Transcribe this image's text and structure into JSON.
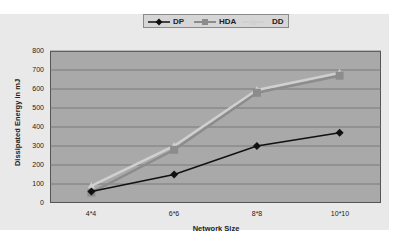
{
  "chart_data": {
    "type": "line",
    "title": "",
    "xlabel": "Network Size",
    "ylabel": "Dissipated Energy in mJ",
    "categories": [
      "4*4",
      "6*6",
      "8*8",
      "10*10"
    ],
    "series": [
      {
        "name": "DP",
        "values": [
          60,
          150,
          300,
          370
        ],
        "color": "#111111",
        "marker": "diamond"
      },
      {
        "name": "HDA",
        "values": [
          55,
          280,
          580,
          670
        ],
        "color": "#8c8c8c",
        "marker": "square"
      },
      {
        "name": "DD",
        "values": [
          90,
          300,
          595,
          685
        ],
        "color": "#d0d0d0",
        "marker": "triangle"
      }
    ],
    "yticks": [
      0,
      100,
      200,
      300,
      400,
      500,
      600,
      700,
      800
    ],
    "ylim": [
      0,
      800
    ],
    "grid": true,
    "legend_position": "top"
  },
  "legend": {
    "items": [
      {
        "label": "DP"
      },
      {
        "label": "HDA"
      },
      {
        "label": "DD"
      }
    ]
  },
  "axes": {
    "y_ticks": [
      "800",
      "700",
      "600",
      "500",
      "400",
      "300",
      "200",
      "100",
      "0"
    ],
    "x_ticks": [
      "4*4",
      "6*6",
      "8*8",
      "10*10"
    ],
    "xlabel": "Network Size",
    "ylabel": "Dissipated Energy in mJ"
  }
}
